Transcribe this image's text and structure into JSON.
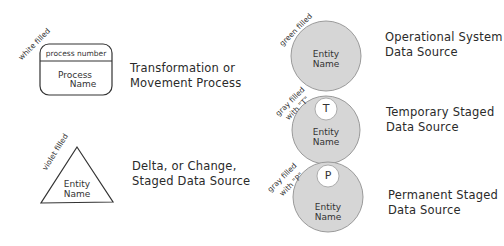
{
  "legend": [
    {
      "id": "process",
      "shape": "rounded-rectangle",
      "fill_note": "white filled",
      "header_text": "process number",
      "body_text_line1": "Process",
      "body_text_line2": "Name",
      "description_line1": "Transformation or",
      "description_line2": "Movement Process",
      "fill_color": "#ffffff"
    },
    {
      "id": "delta",
      "shape": "triangle",
      "fill_note": "violet filled",
      "body_text_line1": "Entity",
      "body_text_line2": "Name",
      "description_line1": "Delta, or Change,",
      "description_line2": "Staged Data Source",
      "fill_color": "#ffffff"
    },
    {
      "id": "operational",
      "shape": "circle",
      "fill_note": "green filled",
      "body_text_line1": "Entity",
      "body_text_line2": "Name",
      "description_line1": "Operational System",
      "description_line2": "Data Source",
      "fill_color": "#d6d6d6"
    },
    {
      "id": "temporary",
      "shape": "circle",
      "fill_note_line1": "gray filled",
      "fill_note_line2": "with \"T\"",
      "marker": "T",
      "body_text_line1": "Entity",
      "body_text_line2": "Name",
      "description_line1": "Temporary Staged",
      "description_line2": "Data Source",
      "fill_color": "#d6d6d6"
    },
    {
      "id": "permanent",
      "shape": "circle",
      "fill_note_line1": "gray filled",
      "fill_note_line2": "with \"P\"",
      "marker": "P",
      "body_text_line1": "Entity",
      "body_text_line2": "Name",
      "description_line1": "Permanent Staged",
      "description_line2": "Data Source",
      "fill_color": "#d6d6d6"
    }
  ]
}
